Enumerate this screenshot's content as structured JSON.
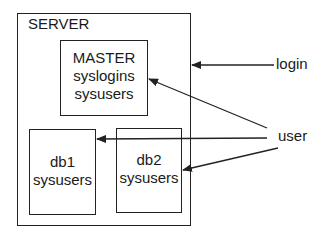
{
  "server": {
    "label": "SERVER"
  },
  "master": {
    "lines": [
      "MASTER",
      "syslogins",
      "sysusers"
    ]
  },
  "db1": {
    "lines": [
      "db1",
      "sysusers"
    ]
  },
  "db2": {
    "lines": [
      "db2",
      "sysusers"
    ]
  },
  "external": {
    "login": "login",
    "user": "user"
  },
  "colors": {
    "line": "#222222",
    "background": "#ffffff"
  }
}
